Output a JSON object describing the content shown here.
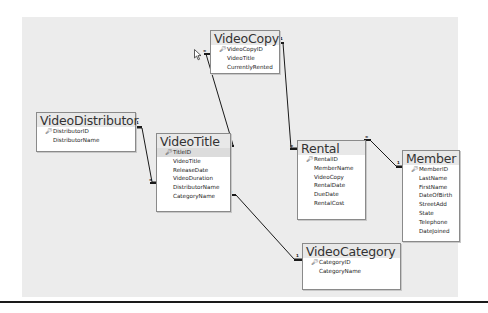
{
  "diagram": {
    "type": "relationships",
    "tables": [
      {
        "id": "videocopy",
        "name": "VideoCopy",
        "fields": [
          {
            "name": "VideoCopyID",
            "primary_key": true
          },
          {
            "name": "VideoTitle",
            "primary_key": false
          },
          {
            "name": "CurrentlyRented",
            "primary_key": false
          }
        ]
      },
      {
        "id": "videodistributor",
        "name": "VideoDistributor",
        "fields": [
          {
            "name": "DistributorID",
            "primary_key": true
          },
          {
            "name": "DistributorName",
            "primary_key": false
          }
        ]
      },
      {
        "id": "videotitle",
        "name": "VideoTitle",
        "fields": [
          {
            "name": "TitleID",
            "primary_key": true
          },
          {
            "name": "VideoTitle",
            "primary_key": false
          },
          {
            "name": "ReleaseDate",
            "primary_key": false
          },
          {
            "name": "VideoDuration",
            "primary_key": false
          },
          {
            "name": "DistributorName",
            "primary_key": false
          },
          {
            "name": "CategoryName",
            "primary_key": false
          }
        ]
      },
      {
        "id": "rental",
        "name": "Rental",
        "fields": [
          {
            "name": "RentalID",
            "primary_key": true
          },
          {
            "name": "MemberName",
            "primary_key": false
          },
          {
            "name": "VideoCopy",
            "primary_key": false
          },
          {
            "name": "RentalDate",
            "primary_key": false
          },
          {
            "name": "DueDate",
            "primary_key": false
          },
          {
            "name": "RentalCost",
            "primary_key": false
          }
        ]
      },
      {
        "id": "member",
        "name": "Member",
        "fields": [
          {
            "name": "MemberID",
            "primary_key": true
          },
          {
            "name": "LastName",
            "primary_key": false
          },
          {
            "name": "FirstName",
            "primary_key": false
          },
          {
            "name": "DateOfBirth",
            "primary_key": false
          },
          {
            "name": "StreetAdd",
            "primary_key": false
          },
          {
            "name": "State",
            "primary_key": false
          },
          {
            "name": "Telephone",
            "primary_key": false
          },
          {
            "name": "DateJoined",
            "primary_key": false
          }
        ]
      },
      {
        "id": "videocategory",
        "name": "VideoCategory",
        "fields": [
          {
            "name": "CategoryID",
            "primary_key": true
          },
          {
            "name": "CategoryName",
            "primary_key": false
          }
        ]
      }
    ],
    "relationships": [
      {
        "from": "VideoDistributor",
        "to": "VideoTitle",
        "from_cardinality": "1",
        "to_cardinality": "∞"
      },
      {
        "from": "VideoTitle",
        "to": "VideoCopy",
        "from_cardinality": "1",
        "to_cardinality": "∞"
      },
      {
        "from": "VideoCopy",
        "to": "Rental",
        "from_cardinality": "1",
        "to_cardinality": "∞"
      },
      {
        "from": "Member",
        "to": "Rental",
        "from_cardinality": "1",
        "to_cardinality": "∞"
      },
      {
        "from": "VideoCategory",
        "to": "VideoTitle",
        "from_cardinality": "1",
        "to_cardinality": "∞"
      }
    ],
    "key_icon": "key-icon",
    "one_symbol": "1",
    "many_symbol": "∞"
  },
  "colors": {
    "canvas": "#ececec",
    "table_border": "#8a8a8a",
    "line": "#1a1a1a"
  }
}
